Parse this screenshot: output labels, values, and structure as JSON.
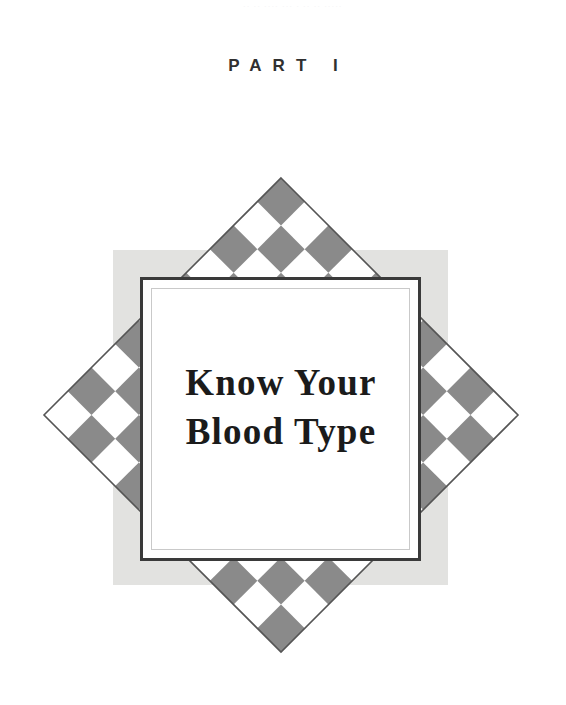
{
  "page": {
    "width": 566,
    "height": 705,
    "background_color": "#ffffff",
    "bleed_through_text": "·· ·· ···· ··· ·  ·· ·· ·····"
  },
  "part_heading": {
    "label": "PART I",
    "text_color": "#303030"
  },
  "title": {
    "line1": "Know Your",
    "line2": "Blood Type",
    "text_color": "#1b1b1b"
  },
  "emblem": {
    "name": "checkerboard-diamond-emblem",
    "diamond": {
      "center_x": 281,
      "center_y": 415,
      "half_diagonal": 237,
      "checker_color": "#8a8a8a",
      "checker_alt_color": "#ffffff",
      "outline_color": "#555555",
      "cells_per_side": 7
    },
    "backing_square": {
      "left": 113,
      "top": 250,
      "right": 448,
      "bottom": 585,
      "fill_color": "#e2e2e0"
    },
    "frame": {
      "left": 140,
      "top": 277,
      "right": 421,
      "bottom": 561,
      "border_color": "#3a3a3a",
      "border_width": 3,
      "inner_line_color": "#c9c9c9",
      "panel_fill": "#ffffff"
    }
  }
}
